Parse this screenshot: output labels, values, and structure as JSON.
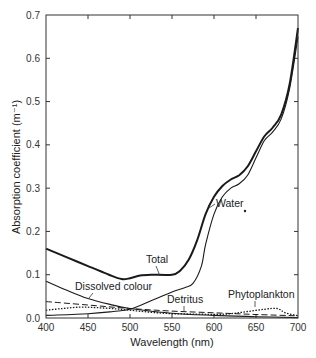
{
  "chart_data": {
    "type": "line",
    "title": "",
    "xlabel": "Wavelength (nm)",
    "ylabel": "Absorption coefficient (m⁻¹)",
    "xlim": [
      400,
      700
    ],
    "ylim": [
      0.0,
      0.7
    ],
    "grid": false,
    "legend": "inline labels",
    "x_ticks": [
      400,
      450,
      500,
      550,
      600,
      650,
      700
    ],
    "x_tick_labels": [
      "400",
      "450",
      "500",
      "550",
      "600",
      "650",
      "700"
    ],
    "y_ticks": [
      0.0,
      0.1,
      0.2,
      0.3,
      0.4,
      0.5,
      0.6,
      0.7
    ],
    "y_tick_labels": [
      "0.0",
      "0.1",
      "0.2",
      "0.3",
      "0.4",
      "0.5",
      "0.6",
      "0.7"
    ],
    "series": [
      {
        "name": "Total",
        "style": "solid-thick",
        "x": [
          400,
          425,
          450,
          475,
          490,
          500,
          512,
          525,
          550,
          560,
          570,
          580,
          590,
          600,
          610,
          620,
          630,
          640,
          650,
          660,
          670,
          680,
          690,
          700
        ],
        "values": [
          0.16,
          0.14,
          0.12,
          0.1,
          0.09,
          0.092,
          0.098,
          0.1,
          0.1,
          0.11,
          0.135,
          0.18,
          0.24,
          0.28,
          0.305,
          0.32,
          0.33,
          0.35,
          0.385,
          0.42,
          0.44,
          0.47,
          0.54,
          0.67
        ]
      },
      {
        "name": "Water",
        "style": "solid",
        "x": [
          400,
          450,
          480,
          500,
          525,
          550,
          565,
          575,
          585,
          590,
          600,
          610,
          620,
          630,
          640,
          650,
          660,
          670,
          680,
          690,
          700
        ],
        "values": [
          0.006,
          0.01,
          0.015,
          0.02,
          0.04,
          0.06,
          0.07,
          0.08,
          0.12,
          0.17,
          0.24,
          0.28,
          0.3,
          0.31,
          0.33,
          0.37,
          0.41,
          0.43,
          0.46,
          0.53,
          0.65
        ]
      },
      {
        "name": "Dissolved colour",
        "style": "solid",
        "x": [
          400,
          425,
          450,
          475,
          500,
          550,
          600,
          650,
          700
        ],
        "values": [
          0.085,
          0.064,
          0.045,
          0.032,
          0.022,
          0.011,
          0.006,
          0.003,
          0.001
        ]
      },
      {
        "name": "Detritus",
        "style": "dashed",
        "x": [
          400,
          450,
          500,
          550,
          600,
          650,
          700
        ],
        "values": [
          0.038,
          0.03,
          0.022,
          0.016,
          0.012,
          0.008,
          0.005
        ]
      },
      {
        "name": "Phytoplankton",
        "style": "dotted",
        "x": [
          400,
          420,
          440,
          460,
          490,
          520,
          550,
          580,
          600,
          620,
          640,
          660,
          675,
          685,
          700
        ],
        "values": [
          0.018,
          0.022,
          0.025,
          0.024,
          0.02,
          0.014,
          0.01,
          0.009,
          0.008,
          0.01,
          0.015,
          0.02,
          0.022,
          0.012,
          0.005
        ]
      }
    ],
    "annotations": [
      {
        "text": "Total",
        "x": 520,
        "y": 0.125
      },
      {
        "text": "Water",
        "x": 615,
        "y": 0.265
      },
      {
        "text": "Dissolved colour",
        "x": 455,
        "y": 0.07
      },
      {
        "text": "Detritus",
        "x": 560,
        "y": 0.04
      },
      {
        "text": "Phytoplankton",
        "x": 650,
        "y": 0.05
      }
    ]
  },
  "labels": {
    "xlabel": "Wavelength (nm)",
    "ylabel": "Absorption coefficient (m⁻¹)",
    "total": "Total",
    "water": "Water",
    "dissolved": "Dissolved colour",
    "detritus": "Detritus",
    "phytoplankton": "Phytoplankton"
  }
}
